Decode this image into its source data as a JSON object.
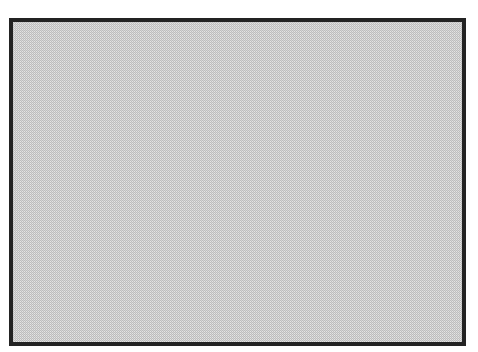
{
  "canvas": {
    "width": 478,
    "height": 352,
    "background_color": "#ffffff"
  },
  "box": {
    "x": 9,
    "y": 18,
    "width": 457,
    "height": 328,
    "border_width": 4,
    "border_color": "#232323",
    "fill": {
      "type": "dither-checkerboard",
      "color_dark": "#bdbdbd",
      "color_light": "#e8e8e8",
      "cell_size_px": 1
    },
    "text": ""
  }
}
